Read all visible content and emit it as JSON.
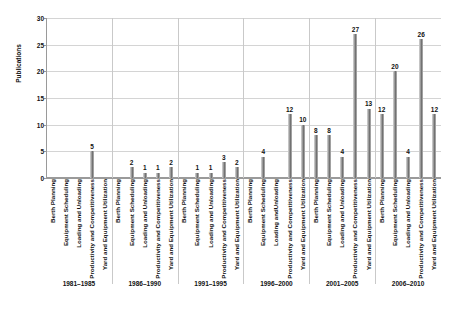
{
  "chart_data": {
    "type": "bar",
    "title": "",
    "xlabel": "",
    "ylabel": "Publications",
    "ylim": [
      0,
      30
    ],
    "yticks": [
      0,
      5,
      10,
      15,
      20,
      25,
      30
    ],
    "grid": true,
    "legend": "none",
    "categories": [
      "Berth Planning",
      "Equipment Scheduling",
      "Loading and Unloading",
      "Productivity and Competitiveness",
      "Yard and Equipment Utilization"
    ],
    "groups": [
      "1981–1985",
      "1986–1990",
      "1991–1995",
      "1996–2000",
      "2001–2005",
      "2006–2010"
    ],
    "series": [
      {
        "name": "1981–1985",
        "values": [
          0,
          0,
          0,
          5,
          0
        ],
        "labels": [
          "",
          "",
          "",
          "5",
          ""
        ]
      },
      {
        "name": "1986–1990",
        "values": [
          0,
          2,
          1,
          1,
          2
        ],
        "labels": [
          "",
          "2",
          "1",
          "1",
          "2"
        ]
      },
      {
        "name": "1991–1995",
        "values": [
          0,
          1,
          1,
          3,
          2
        ],
        "labels": [
          "",
          "1",
          "1",
          "3",
          "2"
        ]
      },
      {
        "name": "1996–2000",
        "values": [
          0,
          4,
          0,
          12,
          10
        ],
        "labels": [
          "",
          "4",
          "",
          "12",
          "10"
        ]
      },
      {
        "name": "2001–2005",
        "values": [
          8,
          8,
          4,
          27,
          13
        ],
        "labels": [
          "8",
          "8",
          "4",
          "27",
          "13"
        ]
      },
      {
        "name": "2006–2010",
        "values": [
          12,
          20,
          4,
          26,
          12
        ],
        "labels": [
          "12",
          "20",
          "4",
          "26",
          "12"
        ]
      }
    ],
    "category_label_overrides": {
      "1996–2000": [
        "Berth Planning",
        "Equipment Scheduling",
        "Loading andUnloading",
        "Productivity and Competitiveness",
        "Yard and Equipment Utilization"
      ]
    },
    "bar_color": "#8f8f8f",
    "grid_color": "#d4d4d4",
    "axis_color": "#9a9a9a"
  }
}
